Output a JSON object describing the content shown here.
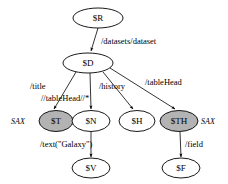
{
  "diagram": {
    "type": "directed-tree-graph",
    "background_color": "#ffffff",
    "node_stroke_color": "#000000",
    "node_fill_default": "#ffffff",
    "node_fill_shaded": "#b3b3b3",
    "edge_color": "#000000",
    "nodes": [
      {
        "id": "R",
        "label": "$R",
        "cx": 98,
        "cy": 18,
        "rx": 25,
        "ry": 10,
        "shaded": false
      },
      {
        "id": "D",
        "label": "$D",
        "cx": 88,
        "cy": 63,
        "rx": 25,
        "ry": 10,
        "shaded": false
      },
      {
        "id": "T",
        "label": "$T",
        "cx": 56,
        "cy": 121,
        "rx": 17,
        "ry": 10.5,
        "shaded": true
      },
      {
        "id": "N",
        "label": "$N",
        "cx": 91,
        "cy": 121,
        "rx": 19,
        "ry": 10.5,
        "shaded": false
      },
      {
        "id": "H",
        "label": "$H",
        "cx": 137,
        "cy": 121,
        "rx": 18,
        "ry": 10.5,
        "shaded": false
      },
      {
        "id": "TH",
        "label": "$TH",
        "cx": 179,
        "cy": 121,
        "rx": 19,
        "ry": 10.5,
        "shaded": true
      },
      {
        "id": "V",
        "label": "$V",
        "cx": 91,
        "cy": 168,
        "rx": 19,
        "ry": 10,
        "shaded": false
      },
      {
        "id": "F",
        "label": "$F",
        "cx": 181,
        "cy": 168,
        "rx": 19,
        "ry": 10,
        "shaded": false
      }
    ],
    "edges": [
      {
        "id": "e-r-d",
        "from": "R",
        "to": "D",
        "x1": 98,
        "y1": 28,
        "x2": 91,
        "y2": 51
      },
      {
        "id": "e-d-t",
        "from": "D",
        "to": "T",
        "x1": 76,
        "y1": 72,
        "x2": 54,
        "y2": 109
      },
      {
        "id": "e-d-n",
        "from": "D",
        "to": "N",
        "x1": 90,
        "y1": 73,
        "x2": 91,
        "y2": 109
      },
      {
        "id": "e-d-h",
        "from": "D",
        "to": "H",
        "x1": 103,
        "y1": 72,
        "x2": 133,
        "y2": 109
      },
      {
        "id": "e-d-th",
        "from": "D",
        "to": "TH",
        "x1": 110,
        "y1": 68,
        "x2": 175,
        "y2": 109
      },
      {
        "id": "e-n-v",
        "from": "N",
        "to": "V",
        "x1": 91,
        "y1": 132,
        "x2": 91,
        "y2": 157
      },
      {
        "id": "e-th-f",
        "from": "TH",
        "to": "F",
        "x1": 180,
        "y1": 132,
        "x2": 181,
        "y2": 157
      }
    ],
    "edge_labels": [
      {
        "id": "lbl-datasets",
        "edge": "e-r-d",
        "text": "/datasets/dataset",
        "x": 101,
        "y": 44,
        "anchor": "start"
      },
      {
        "id": "lbl-title",
        "edge": "e-d-t",
        "text": "/title",
        "x": 30,
        "y": 89,
        "anchor": "start"
      },
      {
        "id": "lbl-tablehead2",
        "edge": "e-d-n",
        "text": "//tableHead//*",
        "x": 41,
        "y": 101,
        "anchor": "start"
      },
      {
        "id": "lbl-history",
        "edge": "e-d-h",
        "text": "/history",
        "x": 99,
        "y": 89,
        "anchor": "start"
      },
      {
        "id": "lbl-tablehead",
        "edge": "e-d-th",
        "text": "/tableHead",
        "x": 145,
        "y": 85,
        "anchor": "start"
      },
      {
        "id": "lbl-text",
        "edge": "e-n-v",
        "text": "/text(\"Galaxy\")",
        "x": 40,
        "y": 147,
        "anchor": "start"
      },
      {
        "id": "lbl-field",
        "edge": "e-th-f",
        "text": "/field",
        "x": 185,
        "y": 147,
        "anchor": "start"
      }
    ],
    "annotations": [
      {
        "id": "ann-sax-left",
        "text": "SAX",
        "node": "T",
        "x": 11,
        "y": 124,
        "anchor": "start"
      },
      {
        "id": "ann-sax-right",
        "text": "SAX",
        "node": "TH",
        "x": 201,
        "y": 124,
        "anchor": "start"
      }
    ]
  }
}
